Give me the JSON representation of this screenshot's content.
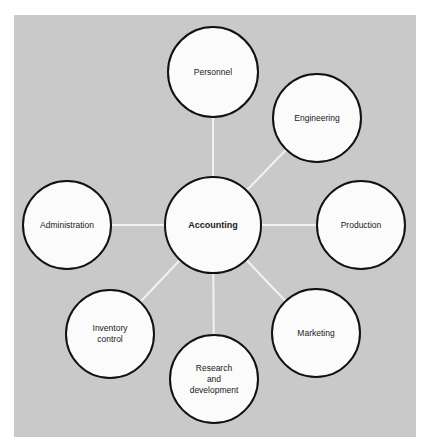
{
  "diagram": {
    "type": "hub-and-spoke",
    "colors": {
      "background": "#c9c9c9",
      "node_fill": "#fbfbfb",
      "node_border": "#111111",
      "connector": "#f2f2f2"
    },
    "center": {
      "id": "accounting",
      "label": "Accounting",
      "cx": 213,
      "cy": 225,
      "r": 49
    },
    "nodes": [
      {
        "id": "personnel",
        "label": "Personnel",
        "cx": 213,
        "cy": 72,
        "r": 46
      },
      {
        "id": "engineering",
        "label": "Engineering",
        "cx": 317,
        "cy": 118,
        "r": 45
      },
      {
        "id": "production",
        "label": "Production",
        "cx": 361,
        "cy": 225,
        "r": 45
      },
      {
        "id": "marketing",
        "label": "Marketing",
        "cx": 316,
        "cy": 333,
        "r": 45
      },
      {
        "id": "research-and-development",
        "label": "Research\nand\ndevelopment",
        "cx": 214,
        "cy": 379,
        "r": 45
      },
      {
        "id": "inventory-control",
        "label": "Inventory\ncontrol",
        "cx": 110,
        "cy": 334,
        "r": 45
      },
      {
        "id": "administration",
        "label": "Administration",
        "cx": 67,
        "cy": 225,
        "r": 45
      }
    ],
    "edges": [
      {
        "from": "accounting",
        "to": "personnel"
      },
      {
        "from": "accounting",
        "to": "engineering"
      },
      {
        "from": "accounting",
        "to": "production"
      },
      {
        "from": "accounting",
        "to": "marketing"
      },
      {
        "from": "accounting",
        "to": "research-and-development"
      },
      {
        "from": "accounting",
        "to": "inventory-control"
      },
      {
        "from": "accounting",
        "to": "administration"
      }
    ]
  }
}
